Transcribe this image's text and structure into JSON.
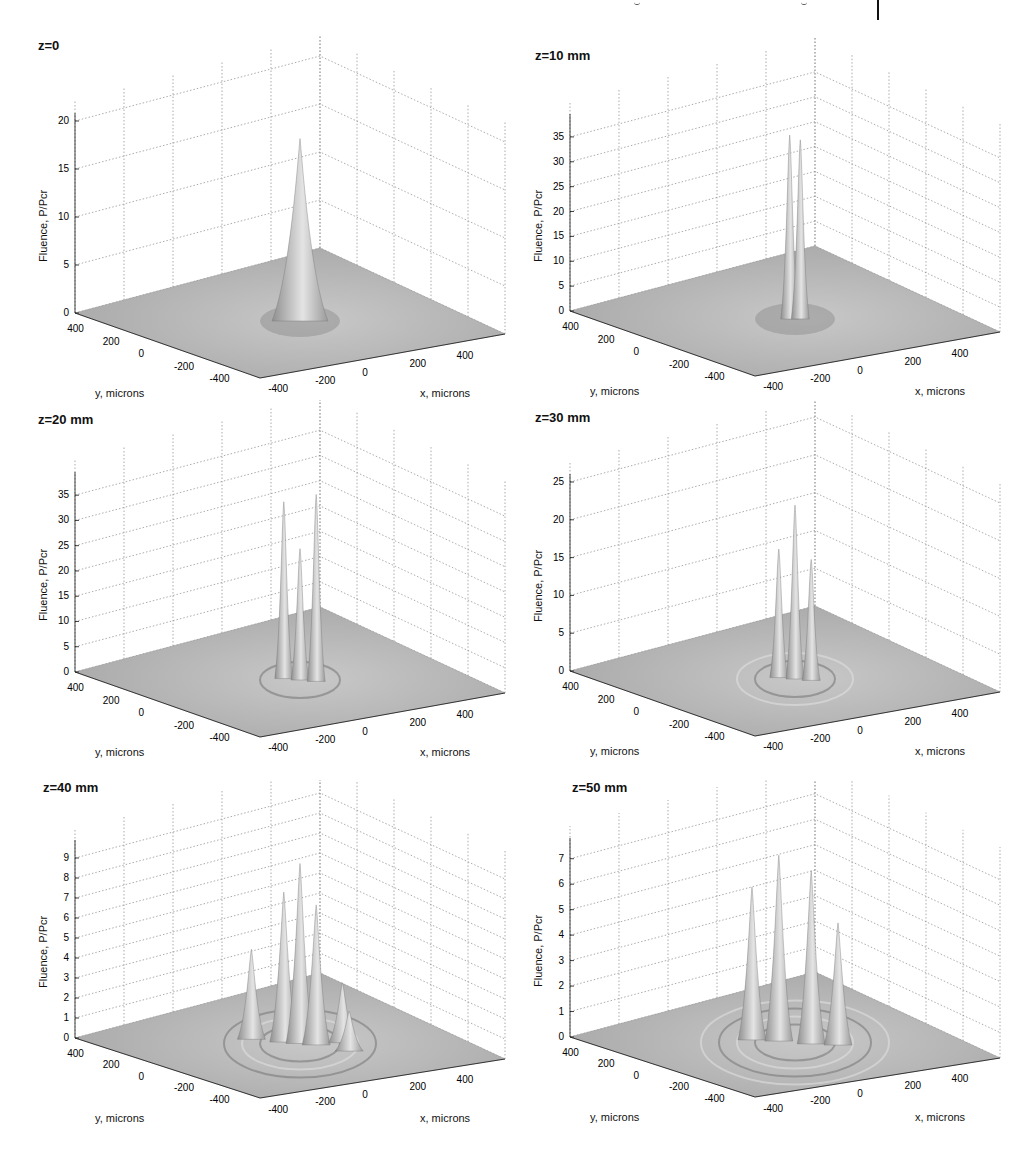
{
  "figure": {
    "panels": [
      {
        "id": "p0",
        "title": "z=0",
        "zmax": 20,
        "zticks": [
          0,
          5,
          10,
          15,
          20
        ]
      },
      {
        "id": "p1",
        "title": "z=10 mm",
        "zmax": 38,
        "zticks": [
          0,
          5,
          10,
          15,
          20,
          25,
          30,
          35
        ]
      },
      {
        "id": "p2",
        "title": "z=20 mm",
        "zmax": 38,
        "zticks": [
          0,
          5,
          10,
          15,
          20,
          25,
          30,
          35
        ]
      },
      {
        "id": "p3",
        "title": "z=30 mm",
        "zmax": 25,
        "zticks": [
          0,
          5,
          10,
          15,
          20,
          25
        ]
      },
      {
        "id": "p4",
        "title": "z=40 mm",
        "zmax": 9.5,
        "zticks": [
          0,
          1,
          2,
          3,
          4,
          5,
          6,
          7,
          8,
          9
        ]
      },
      {
        "id": "p5",
        "title": "z=50 mm",
        "zmax": 7.5,
        "zticks": [
          0,
          1,
          2,
          3,
          4,
          5,
          6,
          7
        ]
      }
    ],
    "zlabel": "Fluence, P/Pcr",
    "xlabel": "x, microns",
    "ylabel": "y, microns",
    "xticks": [
      -400,
      -200,
      0,
      200,
      400
    ],
    "yticks": [
      400,
      200,
      0,
      -200,
      -400
    ]
  },
  "chart_data": [
    {
      "type": "surface",
      "title": "z=0",
      "xlabel": "x, microns",
      "ylabel": "y, microns",
      "zlabel": "Fluence, P/Pcr",
      "xlim": [
        -400,
        400
      ],
      "ylim": [
        -400,
        400
      ],
      "zlim": [
        0,
        20
      ],
      "zticks": [
        0,
        5,
        10,
        15,
        20
      ],
      "grid": true,
      "peaks": [
        {
          "x": 0,
          "y": 0,
          "value": 19
        }
      ]
    },
    {
      "type": "surface",
      "title": "z=10 mm",
      "xlabel": "x, microns",
      "ylabel": "y, microns",
      "zlabel": "Fluence, P/Pcr",
      "xlim": [
        -400,
        400
      ],
      "ylim": [
        -400,
        400
      ],
      "zlim": [
        0,
        38
      ],
      "zticks": [
        0,
        5,
        10,
        15,
        20,
        25,
        30,
        35
      ],
      "grid": true,
      "peaks": [
        {
          "x": -10,
          "y": 10,
          "value": 37
        },
        {
          "x": 10,
          "y": -10,
          "value": 36
        }
      ]
    },
    {
      "type": "surface",
      "title": "z=20 mm",
      "xlabel": "x, microns",
      "ylabel": "y, microns",
      "zlabel": "Fluence, P/Pcr",
      "xlim": [
        -400,
        400
      ],
      "ylim": [
        -400,
        400
      ],
      "zlim": [
        0,
        38
      ],
      "zticks": [
        0,
        5,
        10,
        15,
        20,
        25,
        30,
        35
      ],
      "grid": true,
      "peaks": [
        {
          "x": -40,
          "y": 20,
          "value": 35
        },
        {
          "x": 0,
          "y": 0,
          "value": 26
        },
        {
          "x": 40,
          "y": -20,
          "value": 37
        }
      ]
    },
    {
      "type": "surface",
      "title": "z=30 mm",
      "xlabel": "x, microns",
      "ylabel": "y, microns",
      "zlabel": "Fluence, P/Pcr",
      "xlim": [
        -400,
        400
      ],
      "ylim": [
        -400,
        400
      ],
      "zlim": [
        0,
        25
      ],
      "zticks": [
        0,
        5,
        10,
        15,
        20,
        25
      ],
      "grid": true,
      "peaks": [
        {
          "x": -40,
          "y": 20,
          "value": 17
        },
        {
          "x": 0,
          "y": 0,
          "value": 23
        },
        {
          "x": 40,
          "y": -20,
          "value": 16
        }
      ]
    },
    {
      "type": "surface",
      "title": "z=40 mm",
      "xlabel": "x, microns",
      "ylabel": "y, microns",
      "zlabel": "Fluence, P/Pcr",
      "xlim": [
        -400,
        400
      ],
      "ylim": [
        -400,
        400
      ],
      "zlim": [
        0,
        9.5
      ],
      "zticks": [
        0,
        1,
        2,
        3,
        4,
        5,
        6,
        7,
        8,
        9
      ],
      "grid": true,
      "peaks": [
        {
          "x": -120,
          "y": 60,
          "value": 4.5
        },
        {
          "x": -40,
          "y": 20,
          "value": 7.5
        },
        {
          "x": 0,
          "y": 0,
          "value": 9
        },
        {
          "x": 40,
          "y": -20,
          "value": 7
        },
        {
          "x": 80,
          "y": -80,
          "value": 3
        },
        {
          "x": 140,
          "y": -40,
          "value": 2
        }
      ]
    },
    {
      "type": "surface",
      "title": "z=50 mm",
      "xlabel": "x, microns",
      "ylabel": "y, microns",
      "zlabel": "Fluence, P/Pcr",
      "xlim": [
        -400,
        400
      ],
      "ylim": [
        -400,
        400
      ],
      "zlim": [
        0,
        7.5
      ],
      "zticks": [
        0,
        1,
        2,
        3,
        4,
        5,
        6,
        7
      ],
      "grid": true,
      "peaks": [
        {
          "x": -100,
          "y": 60,
          "value": 6
        },
        {
          "x": -40,
          "y": 20,
          "value": 7.3
        },
        {
          "x": 40,
          "y": -20,
          "value": 6.8
        },
        {
          "x": 100,
          "y": -60,
          "value": 4.8
        }
      ]
    }
  ]
}
